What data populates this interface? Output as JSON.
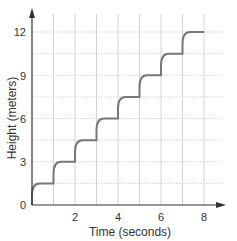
{
  "chart_data": {
    "type": "line",
    "title": "",
    "xlabel": "Time (seconds)",
    "ylabel": "Height (meters)",
    "xlim": [
      0,
      8
    ],
    "ylim": [
      0,
      12
    ],
    "x_ticks": [
      2,
      4,
      6,
      8
    ],
    "y_ticks": [
      0,
      3,
      6,
      9,
      12
    ],
    "x_grid_step": 1,
    "y_grid_step": 1.5,
    "grid": true,
    "legend": null,
    "series": [
      {
        "name": "Height",
        "color": "#777777",
        "x": [
          0,
          1,
          2,
          3,
          4,
          5,
          6,
          7,
          8
        ],
        "values": [
          0,
          1.5,
          3,
          4.5,
          6,
          7.5,
          9,
          10.5,
          12
        ],
        "step_rise_per_second": 1.5,
        "plateaus": [
          {
            "from": 0.3,
            "to": 1,
            "height": 1.5
          },
          {
            "from": 1.3,
            "to": 2,
            "height": 3
          },
          {
            "from": 2.3,
            "to": 3,
            "height": 4.5
          },
          {
            "from": 3.3,
            "to": 4,
            "height": 6
          },
          {
            "from": 4.3,
            "to": 5,
            "height": 7.5
          },
          {
            "from": 5.3,
            "to": 6,
            "height": 9
          },
          {
            "from": 6.3,
            "to": 7,
            "height": 10.5
          },
          {
            "from": 7.3,
            "to": 8,
            "height": 12
          }
        ]
      }
    ]
  },
  "labels": {
    "x_axis": "Time (seconds)",
    "y_axis": "Height (meters)",
    "x_ticks": [
      "2",
      "4",
      "6",
      "8"
    ],
    "y_ticks": [
      "0",
      "3",
      "6",
      "9",
      "12"
    ]
  },
  "colors": {
    "grid": "#c8c8c8",
    "axis": "#333333",
    "curve": "#777777"
  }
}
